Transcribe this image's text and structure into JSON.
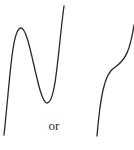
{
  "diagram": {
    "connector_text": "or",
    "stroke_color": "#2a2a2a",
    "background": "#ffffff",
    "curves": [
      {
        "name": "cubic-with-turning-points",
        "path": "M4,135 C10,80 12,28 21,28 C30,28 38,103 47,103 C56,103 58,50 64,6"
      },
      {
        "name": "cubic-with-inflection",
        "path": "M97,136 C100,100 104,74 114,68 C126,60 130,50 134,25"
      }
    ]
  }
}
